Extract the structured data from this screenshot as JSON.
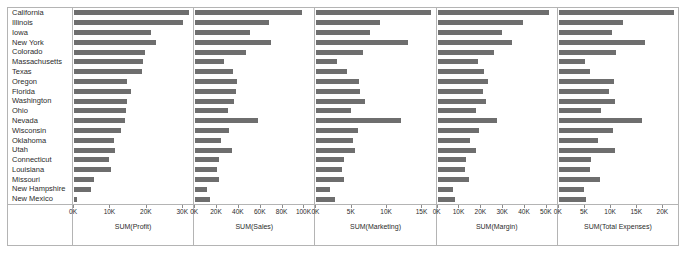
{
  "chart_data": {
    "type": "bar",
    "title": "",
    "layout": "small-multiples, 5 horizontal bar panels sharing one categorical y-axis",
    "orientation": "horizontal",
    "grid": false,
    "legend": false,
    "bar_color": "#6e6e6e",
    "frame_color": "#b4b4b4",
    "ylabel": "",
    "categories": [
      "California",
      "Illinois",
      "Iowa",
      "New York",
      "Colorado",
      "Massachusetts",
      "Texas",
      "Oregon",
      "Florida",
      "Washington",
      "Ohio",
      "Nevada",
      "Wisconsin",
      "Oklahoma",
      "Utah",
      "Connecticut",
      "Louisiana",
      "Missouri",
      "New Hampshire",
      "New Mexico"
    ],
    "panels": [
      {
        "name": "profit",
        "xlabel": "SUM(Profit)",
        "ticks": [
          "0K",
          "10K",
          "20K",
          "30K"
        ],
        "tick_values": [
          0,
          10000,
          20000,
          30000
        ],
        "xlim": [
          0,
          33000
        ],
        "values": [
          31900,
          30200,
          21200,
          22600,
          19700,
          19100,
          18800,
          14800,
          15700,
          14700,
          14500,
          14100,
          13000,
          11000,
          11400,
          9800,
          10300,
          5400,
          4700,
          800
        ]
      },
      {
        "name": "sales",
        "xlabel": "SUM(Sales)",
        "ticks": [
          "0K",
          "20K",
          "40K",
          "60K",
          "80K",
          "100K"
        ],
        "tick_values": [
          0,
          20000,
          40000,
          60000,
          80000,
          100000
        ],
        "xlim": [
          0,
          110000
        ],
        "values": [
          99000,
          68500,
          50500,
          70000,
          46500,
          27000,
          34500,
          38500,
          37500,
          35500,
          30500,
          57500,
          31000,
          23500,
          33500,
          22000,
          20500,
          21500,
          10500,
          13500
        ]
      },
      {
        "name": "marketing",
        "xlabel": "SUM(Marketing)",
        "ticks": [
          "0K",
          "5K",
          "10K",
          "15K"
        ],
        "tick_values": [
          0,
          5000,
          10000,
          15000
        ],
        "xlim": [
          0,
          17000
        ],
        "values": [
          16400,
          9000,
          7600,
          13000,
          6700,
          2900,
          4300,
          6100,
          6200,
          7000,
          5000,
          12000,
          6000,
          5200,
          5500,
          3900,
          3600,
          4000,
          1900,
          2600
        ]
      },
      {
        "name": "margin",
        "xlabel": "SUM(Margin)",
        "ticks": [
          "0K",
          "10K",
          "20K",
          "30K",
          "40K",
          "50K"
        ],
        "tick_values": [
          0,
          10000,
          20000,
          30000,
          40000,
          50000
        ],
        "xlim": [
          0,
          55000
        ],
        "values": [
          51500,
          39500,
          29500,
          34500,
          26000,
          18500,
          21500,
          23200,
          20900,
          22400,
          17800,
          27400,
          19000,
          15000,
          17900,
          13000,
          12600,
          14700,
          7200,
          7800
        ]
      },
      {
        "name": "total_expenses",
        "xlabel": "SUM(Total Expenses)",
        "ticks": [
          "0K",
          "5K",
          "10K",
          "15K",
          "20K"
        ],
        "tick_values": [
          0,
          5000,
          10000,
          15000,
          20000
        ],
        "xlim": [
          0,
          23000
        ],
        "values": [
          22300,
          12300,
          10300,
          16700,
          11000,
          5000,
          6000,
          10700,
          9700,
          10800,
          8200,
          16000,
          10400,
          7500,
          10800,
          6300,
          6000,
          8000,
          4900,
          5200
        ]
      }
    ]
  }
}
